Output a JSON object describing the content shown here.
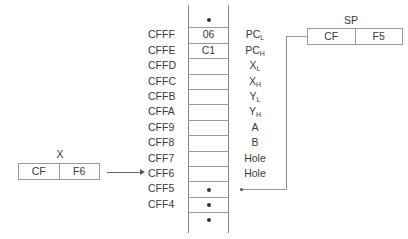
{
  "stack": {
    "rows": [
      {
        "addr": "",
        "value": "•",
        "label": "",
        "sub": ""
      },
      {
        "addr": "CFFF",
        "value": "06",
        "label": "PC",
        "sub": "L"
      },
      {
        "addr": "CFFE",
        "value": "C1",
        "label": "PC",
        "sub": "H"
      },
      {
        "addr": "CFFD",
        "value": "",
        "label": "X",
        "sub": "L"
      },
      {
        "addr": "CFFC",
        "value": "",
        "label": "X",
        "sub": "H"
      },
      {
        "addr": "CFFB",
        "value": "",
        "label": "Y",
        "sub": "L"
      },
      {
        "addr": "CFFA",
        "value": "",
        "label": "Y",
        "sub": "H"
      },
      {
        "addr": "CFF9",
        "value": "",
        "label": "A",
        "sub": ""
      },
      {
        "addr": "CFF8",
        "value": "",
        "label": "B",
        "sub": ""
      },
      {
        "addr": "CFF7",
        "value": "",
        "label": "Hole",
        "sub": ""
      },
      {
        "addr": "CFF6",
        "value": "",
        "label": "Hole",
        "sub": ""
      },
      {
        "addr": "CFF5",
        "value": "•",
        "label": "",
        "sub": ""
      },
      {
        "addr": "CFF4",
        "value": "•",
        "label": "",
        "sub": ""
      },
      {
        "addr": "",
        "value": "•",
        "label": "",
        "sub": ""
      }
    ]
  },
  "sp_register": {
    "title": "SP",
    "high": "CF",
    "low": "F5"
  },
  "x_register": {
    "title": "X",
    "high": "CF",
    "low": "F6"
  }
}
